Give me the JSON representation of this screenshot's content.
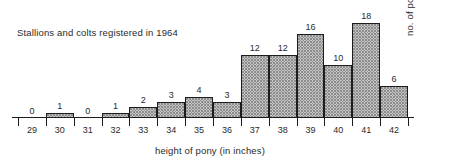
{
  "chart_data": {
    "type": "bar",
    "title": "Stallions and colts registered in 1964",
    "xlabel": "height of pony (in inches)",
    "ylabel": "no. of ponies",
    "categories": [
      "29",
      "30",
      "31",
      "32",
      "33",
      "34",
      "35",
      "36",
      "37",
      "38",
      "39",
      "40",
      "41",
      "42"
    ],
    "values": [
      0,
      1,
      0,
      1,
      2,
      3,
      4,
      3,
      12,
      12,
      16,
      10,
      18,
      6
    ],
    "value_labels": [
      "0",
      "1",
      "0",
      "1",
      "2",
      "3",
      "4",
      "3",
      "12",
      "12",
      "16",
      "10",
      "18",
      "6"
    ],
    "ylim": [
      0,
      19
    ],
    "grid": false,
    "legend": null,
    "axis_color": "#1d1d1d",
    "bar_fill": "#fdfdfd",
    "bar_pattern": "stipple-dots",
    "bar_edge": "#1d1d1d"
  }
}
